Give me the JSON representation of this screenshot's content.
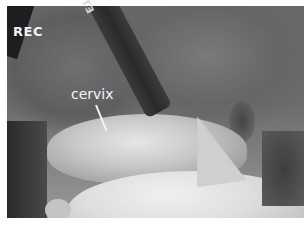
{
  "image": {
    "description": "Grayscale laparoscopic surgical video frame",
    "overlay": {
      "recording_indicator": "REC"
    },
    "annotations": [
      {
        "label": "cervix",
        "pointer": "arrow"
      }
    ],
    "instrument": {
      "brand_text": "ETHICON"
    }
  }
}
